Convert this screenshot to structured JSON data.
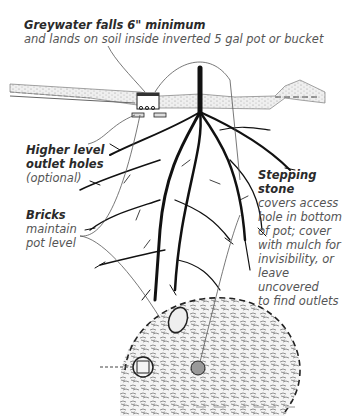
{
  "labels": {
    "greywater": {
      "title": "Greywater falls 6\" minimum",
      "desc": "and lands on soil inside inverted 5 gal pot or bucket"
    },
    "outlet": {
      "title_line1": "Higher level",
      "title_line2": "outlet holes",
      "desc": "(optional)"
    },
    "bricks": {
      "title": "Bricks",
      "desc_line1": "maintain",
      "desc_line2": "pot level"
    },
    "stone": {
      "title_line1": "Stepping",
      "title_line2": "stone",
      "desc_lines": [
        "covers access",
        "hole in bottom",
        "of pot; cover",
        "with mulch for",
        "invisibility, or",
        "leave uncovered",
        "to find outlets"
      ]
    }
  },
  "colors": {
    "ink": "#111111",
    "soil": "#bdbdbd",
    "leader": "#555555"
  }
}
